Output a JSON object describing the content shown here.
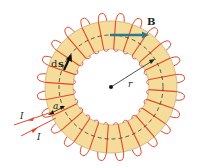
{
  "diagram": {
    "labels": {
      "field": "B",
      "path_element_d": "d",
      "path_element_s": "s",
      "radius": "r",
      "width": "a",
      "current_in": "I",
      "current_out": "I"
    },
    "colors": {
      "core": "#f5dc9a",
      "core_edge": "#b8a070",
      "winding": "#e0482a",
      "field_arrow": "#2a7a8a",
      "dashed_path": "#333333"
    },
    "geometry": {
      "center": [
        111,
        87
      ],
      "outer_radius": 66,
      "inner_radius": 38,
      "path_radius": 52,
      "turns": 24
    }
  }
}
